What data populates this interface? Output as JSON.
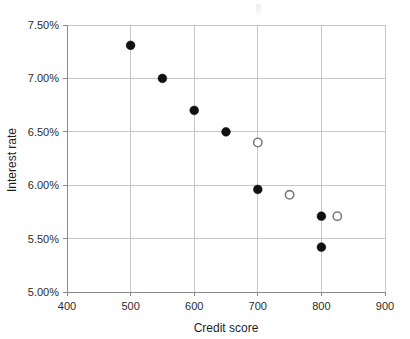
{
  "chart_data": {
    "type": "scatter",
    "title": "",
    "xlabel": "Credit score",
    "ylabel": "Interest rate",
    "xlim": [
      400,
      900
    ],
    "ylim": [
      5.0,
      7.5
    ],
    "xticks": [
      400,
      500,
      600,
      700,
      800,
      900
    ],
    "yticks": [
      5.0,
      5.5,
      6.0,
      6.5,
      7.0,
      7.5
    ],
    "xtick_labels": [
      "400",
      "500",
      "600",
      "700",
      "800",
      "900"
    ],
    "ytick_labels": [
      "5.00%",
      "5.50%",
      "6.00%",
      "6.50%",
      "7.00%",
      "7.50%"
    ],
    "grid": true,
    "legend": "none",
    "series": [
      {
        "name": "filled-markers",
        "marker": "filled-circle",
        "color": "#111111",
        "points": [
          {
            "x": 500,
            "y": 7.31
          },
          {
            "x": 550,
            "y": 7.0
          },
          {
            "x": 600,
            "y": 6.7
          },
          {
            "x": 650,
            "y": 6.5
          },
          {
            "x": 700,
            "y": 5.96
          },
          {
            "x": 800,
            "y": 5.71
          },
          {
            "x": 800,
            "y": 5.42
          }
        ]
      },
      {
        "name": "open-markers",
        "marker": "open-circle",
        "color": "#7c7c7c",
        "points": [
          {
            "x": 700,
            "y": 6.4
          },
          {
            "x": 750,
            "y": 5.91
          },
          {
            "x": 825,
            "y": 5.71
          }
        ]
      }
    ]
  },
  "colors": {
    "grid": "#b9b9b9",
    "axis": "#8a8a8a",
    "filled_marker": "#111111",
    "open_marker_stroke": "#7c7c7c",
    "background": "#ffffff"
  }
}
